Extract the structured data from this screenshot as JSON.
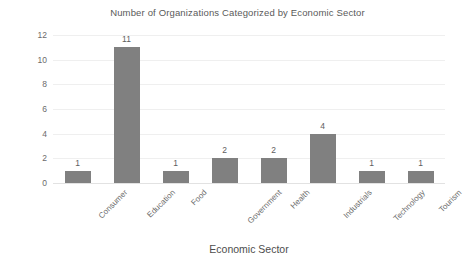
{
  "chart_data": {
    "type": "bar",
    "title": "Number of Organizations Categorized by Economic Sector",
    "xlabel": "Economic Sector",
    "ylabel": "# of Organizations",
    "categories": [
      "Consumer",
      "Education",
      "Food",
      "Government",
      "Health",
      "Industrials",
      "Technology",
      "Tourism"
    ],
    "values": [
      1,
      11,
      1,
      2,
      2,
      4,
      1,
      1
    ],
    "data_labels": [
      "1",
      "11",
      "1",
      "2",
      "2",
      "4",
      "1",
      "1"
    ],
    "ylim": [
      0,
      12
    ],
    "ytick_labels": [
      "0",
      "2",
      "4",
      "6",
      "8",
      "10",
      "12"
    ],
    "ytick_values": [
      0,
      2,
      4,
      6,
      8,
      10,
      12
    ],
    "grid": true,
    "grid_orientation": "horizontal",
    "legend": false,
    "bar_color": "#808080",
    "background_color": "#ffffff",
    "gridline_color": "#efefef",
    "axis_color": "#e2e2e2",
    "text_color": "#5a5a5a",
    "xtick_rotation": -45
  }
}
